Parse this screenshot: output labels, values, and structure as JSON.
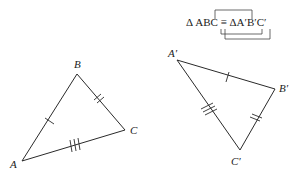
{
  "notation": {
    "text": "Δ ABC ≡ ΔA′B′C′",
    "left": "Δ ABC",
    "symbol": "≡",
    "right": "ΔA′B′C′"
  },
  "triangle_abc": {
    "vertices": {
      "A": {
        "label": "A",
        "x": 22,
        "y": 161
      },
      "B": {
        "label": "B",
        "x": 77,
        "y": 74
      },
      "C": {
        "label": "C",
        "x": 125,
        "y": 130
      }
    },
    "tick_marks": {
      "AB": 1,
      "BC": 2,
      "CA": 3
    }
  },
  "triangle_a2b2c2": {
    "vertices": {
      "A2": {
        "label": "A′",
        "x": 177,
        "y": 60
      },
      "B2": {
        "label": "B′",
        "x": 275,
        "y": 89
      },
      "C2": {
        "label": "C′",
        "x": 240,
        "y": 150
      }
    },
    "tick_marks": {
      "A2B2": 1,
      "B2C2": 2,
      "C2A2": 3
    }
  },
  "colors": {
    "line": "#2a2a2a",
    "text": "#222222",
    "background": "#ffffff"
  }
}
